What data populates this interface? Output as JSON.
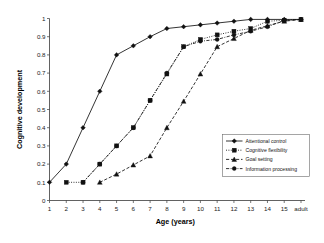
{
  "chart_data": {
    "type": "line",
    "title": "",
    "xlabel": "Age (years)",
    "ylabel": "Cognitive development",
    "categories": [
      "1",
      "2",
      "3",
      "4",
      "5",
      "6",
      "7",
      "8",
      "9",
      "10",
      "11",
      "12",
      "13",
      "14",
      "15",
      "adult"
    ],
    "xlim": [
      0,
      15
    ],
    "ylim": [
      0,
      1
    ],
    "ytick_labels": [
      "0",
      "0.1",
      "0.2",
      "0.3",
      "0.4",
      "0.5",
      "0.6",
      "0.7",
      "0.8",
      "0.9",
      "1"
    ],
    "ytick_values": [
      0,
      0.1,
      0.2,
      0.3,
      0.4,
      0.5,
      0.6,
      0.7,
      0.8,
      0.9,
      1
    ],
    "grid": false,
    "legend_position": "right-middle",
    "series": [
      {
        "name": "Attentional control",
        "line_style": "solid",
        "marker": "diamond",
        "x": [
          "1",
          "2",
          "3",
          "4",
          "5",
          "6",
          "7",
          "8",
          "9",
          "10",
          "11",
          "12",
          "13",
          "14",
          "15",
          "adult"
        ],
        "values": [
          0.1,
          0.2,
          0.4,
          0.6,
          0.8,
          0.85,
          0.9,
          0.945,
          0.955,
          0.965,
          0.975,
          0.985,
          0.995,
          0.995,
          0.995,
          0.995
        ]
      },
      {
        "name": "Cognitive flexibility",
        "line_style": "dotted",
        "marker": "square",
        "x": [
          "2",
          "3",
          "4",
          "5",
          "6",
          "7",
          "8",
          "9",
          "10",
          "11",
          "12",
          "13",
          "14",
          "15",
          "adult"
        ],
        "values": [
          0.1,
          0.1,
          0.2,
          0.3,
          0.4,
          0.55,
          0.695,
          0.845,
          0.885,
          0.91,
          0.93,
          0.945,
          0.985,
          0.99,
          0.995
        ]
      },
      {
        "name": "Goal setting",
        "line_style": "dashed",
        "marker": "triangle",
        "x": [
          "4",
          "5",
          "6",
          "7",
          "8",
          "9",
          "10",
          "11",
          "12",
          "13",
          "14",
          "15",
          "adult"
        ],
        "values": [
          0.1,
          0.145,
          0.195,
          0.245,
          0.4,
          0.545,
          0.695,
          0.845,
          0.89,
          0.935,
          0.96,
          0.985,
          0.995
        ]
      },
      {
        "name": "Information processing",
        "line_style": "dash-dot",
        "marker": "circle",
        "x": [
          "3",
          "4",
          "5",
          "6",
          "7",
          "8",
          "9",
          "10",
          "11",
          "12",
          "13",
          "14",
          "15",
          "adult"
        ],
        "values": [
          0.1,
          0.2,
          0.3,
          0.4,
          0.55,
          0.7,
          0.845,
          0.875,
          0.885,
          0.91,
          0.93,
          0.955,
          0.99,
          0.995
        ]
      }
    ]
  }
}
